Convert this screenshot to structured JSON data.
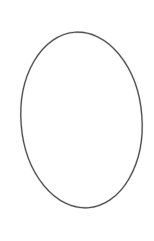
{
  "canvas": {
    "width": 154,
    "height": 241,
    "background_color": "#ffffff",
    "alt_text": "Hand-drawn ellipse outline"
  },
  "figure": {
    "shape_name": "ellipse",
    "label": "Ellipse outline",
    "stroke_color": "#4a4a4a",
    "halo_color": "#8d8d8d",
    "fill": "none",
    "stroke_width": 1.15,
    "center_x": 81.5,
    "center_y": 120,
    "radius_x": 60.5,
    "radius_y": 88,
    "rotation_deg": -4.5,
    "bounds": {
      "left": 21,
      "top": 32,
      "right": 142,
      "bottom": 208
    }
  }
}
